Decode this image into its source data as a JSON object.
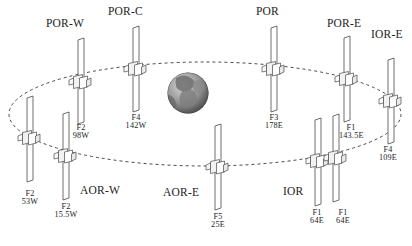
{
  "figure": {
    "type": "orbit-diagram",
    "width": 412,
    "height": 246,
    "background_color": "#ffffff",
    "line_color": "#4a4a4a",
    "text_color": "#1c1c1c"
  },
  "earth": {
    "name": "earth-globe",
    "cx": 188,
    "cy": 93,
    "r": 20.5
  },
  "orbit": {
    "name": "geostationary-orbit-ellipse",
    "style": "dashed",
    "cx": 205,
    "cy": 114,
    "rx": 196,
    "ry": 52,
    "dash": "3 3"
  },
  "region_labels": [
    {
      "id": "por-w",
      "text": "POR-W",
      "x": 46,
      "y": 18
    },
    {
      "id": "por-c",
      "text": "POR-C",
      "x": 108,
      "y": 6
    },
    {
      "id": "por",
      "text": "POR",
      "x": 256,
      "y": 6
    },
    {
      "id": "por-e",
      "text": "POR-E",
      "x": 327,
      "y": 18
    },
    {
      "id": "ior-e",
      "text": "IOR-E",
      "x": 371,
      "y": 29
    },
    {
      "id": "aor-w",
      "text": "AOR-W",
      "x": 80,
      "y": 185
    },
    {
      "id": "aor-e",
      "text": "AOR-E",
      "x": 163,
      "y": 187
    },
    {
      "id": "ior",
      "text": "IOR",
      "x": 283,
      "y": 186
    }
  ],
  "satellites": [
    {
      "id": "sat-f2-53w",
      "designation": "F2",
      "longitude": "53W",
      "bar_x": 27,
      "bar_top": 96,
      "bar_height": 86,
      "bus_y": 137,
      "label_x": 27,
      "label_y": 190
    },
    {
      "id": "sat-f2-155w",
      "designation": "F2",
      "longitude": "15.5W",
      "bar_x": 63,
      "bar_top": 112,
      "bar_height": 88,
      "bus_y": 155,
      "label_x": 63,
      "label_y": 203
    },
    {
      "id": "sat-f2-98w",
      "designation": "F2",
      "longitude": "98W",
      "bar_x": 78,
      "bar_top": 38,
      "bar_height": 86,
      "bus_y": 81,
      "label_x": 78,
      "label_y": 124
    },
    {
      "id": "sat-f4-142w",
      "designation": "F4",
      "longitude": "142W",
      "bar_x": 133,
      "bar_top": 26,
      "bar_height": 86,
      "bus_y": 68,
      "label_x": 133,
      "label_y": 114
    },
    {
      "id": "sat-f5-25e",
      "designation": "F5",
      "longitude": "25E",
      "bar_x": 215,
      "bar_top": 124,
      "bar_height": 86,
      "bus_y": 166,
      "label_x": 215,
      "label_y": 213
    },
    {
      "id": "sat-f3-178e",
      "designation": "F3",
      "longitude": "178E",
      "bar_x": 271,
      "bar_top": 26,
      "bar_height": 86,
      "bus_y": 68,
      "label_x": 271,
      "label_y": 114
    },
    {
      "id": "sat-f1-64e-a",
      "designation": "F1",
      "longitude": "64E",
      "bar_x": 315,
      "bar_top": 118,
      "bar_height": 88,
      "bus_y": 160,
      "label_x": 314,
      "label_y": 209
    },
    {
      "id": "sat-f1-64e-b",
      "designation": "F1",
      "longitude": "64E",
      "bar_x": 333,
      "bar_top": 114,
      "bar_height": 88,
      "bus_y": 157,
      "label_x": 340,
      "label_y": 209
    },
    {
      "id": "sat-f1-1435e",
      "designation": "F1",
      "longitude": "143.5E",
      "bar_x": 344,
      "bar_top": 36,
      "bar_height": 86,
      "bus_y": 78,
      "label_x": 348,
      "label_y": 124
    },
    {
      "id": "sat-f4-109e",
      "designation": "F4",
      "longitude": "109E",
      "bar_x": 388,
      "bar_top": 58,
      "bar_height": 86,
      "bus_y": 100,
      "label_x": 385,
      "label_y": 146
    }
  ]
}
